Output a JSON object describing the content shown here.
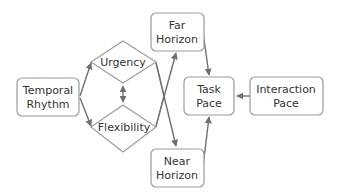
{
  "diagram": {
    "type": "flow-diagram",
    "nodes": {
      "temporal_rhythm": {
        "line1": "Temporal",
        "line2": "Rhythm"
      },
      "urgency": {
        "label": "Urgency"
      },
      "flexibility": {
        "label": "Flexibility"
      },
      "far_horizon": {
        "line1": "Far",
        "line2": "Horizon"
      },
      "near_horizon": {
        "line1": "Near",
        "line2": "Horizon"
      },
      "task_pace": {
        "line1": "Task",
        "line2": "Pace"
      },
      "interaction_pace": {
        "line1": "Interaction",
        "line2": "Pace"
      }
    },
    "edges": [
      {
        "from": "Temporal Rhythm",
        "to": "Urgency"
      },
      {
        "from": "Temporal Rhythm",
        "to": "Flexibility"
      },
      {
        "from": "Urgency",
        "to": "Flexibility",
        "bidirectional": true
      },
      {
        "from": "Urgency",
        "to": "Near Horizon"
      },
      {
        "from": "Flexibility",
        "to": "Far Horizon"
      },
      {
        "from": "Far Horizon",
        "to": "Task Pace"
      },
      {
        "from": "Near Horizon",
        "to": "Task Pace"
      },
      {
        "from": "Interaction Pace",
        "to": "Task Pace"
      }
    ],
    "colors": {
      "stroke": "#9a9a9a",
      "arrow": "#6f6f6f",
      "text": "#333333",
      "background": "#ffffff"
    }
  }
}
